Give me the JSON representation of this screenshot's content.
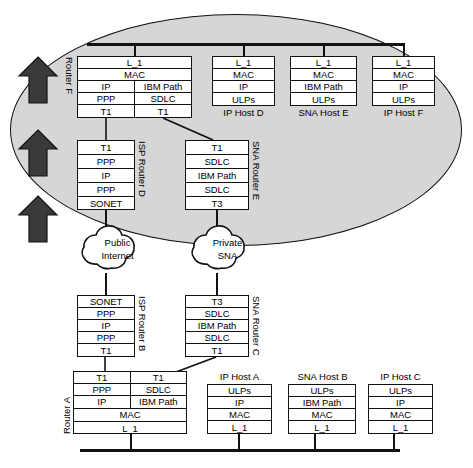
{
  "diagram": {
    "cloud_region_label": "",
    "colors": {
      "ellipse_fill": "#d6d6d6",
      "line": "#111111",
      "box_fill": "#ffffff"
    }
  },
  "arrows": {
    "name": "upward-flow-arrows",
    "count": 3,
    "direction": "up"
  },
  "top_bus": {
    "name": "upper-lan-segment"
  },
  "bottom_bus": {
    "name": "lower-lan-segment"
  },
  "clouds": [
    {
      "id": "public-internet",
      "line1": "Public",
      "line2": "Internet"
    },
    {
      "id": "private-sna",
      "line1": "Private",
      "line2": "SNA"
    }
  ],
  "stacks": [
    {
      "id": "router-f",
      "label": "Router F",
      "label_position": "left-vertical",
      "caption": "",
      "columns": 2,
      "rows": [
        {
          "cells": [
            "L_1"
          ],
          "span": true
        },
        {
          "cells": [
            "MAC"
          ],
          "span": true
        },
        {
          "cells": [
            "IP",
            "IBM Path"
          ],
          "span": false
        },
        {
          "cells": [
            "PPP",
            "SDLC"
          ],
          "span": false
        },
        {
          "cells": [
            "T1",
            "T1"
          ],
          "span": false
        }
      ]
    },
    {
      "id": "ip-host-d",
      "label": "",
      "caption": "IP Host D",
      "columns": 1,
      "rows": [
        {
          "cells": [
            "L_1"
          ],
          "span": true
        },
        {
          "cells": [
            "MAC"
          ],
          "span": true
        },
        {
          "cells": [
            "IP"
          ],
          "span": true
        },
        {
          "cells": [
            "ULPs"
          ],
          "span": true
        }
      ]
    },
    {
      "id": "sna-host-e",
      "label": "",
      "caption": "SNA Host E",
      "columns": 1,
      "rows": [
        {
          "cells": [
            "L_1"
          ],
          "span": true
        },
        {
          "cells": [
            "MAC"
          ],
          "span": true
        },
        {
          "cells": [
            "IBM Path"
          ],
          "span": true
        },
        {
          "cells": [
            "ULPs"
          ],
          "span": true
        }
      ]
    },
    {
      "id": "ip-host-f",
      "label": "",
      "caption": "IP Host F",
      "columns": 1,
      "rows": [
        {
          "cells": [
            "L_1"
          ],
          "span": true
        },
        {
          "cells": [
            "MAC"
          ],
          "span": true
        },
        {
          "cells": [
            "IP"
          ],
          "span": true
        },
        {
          "cells": [
            "ULPs"
          ],
          "span": true
        }
      ]
    },
    {
      "id": "isp-router-d",
      "label": "ISP Router D",
      "label_position": "right-vertical",
      "caption": "",
      "columns": 1,
      "rows": [
        {
          "cells": [
            "T1"
          ],
          "span": true
        },
        {
          "cells": [
            "PPP"
          ],
          "span": true
        },
        {
          "cells": [
            "IP"
          ],
          "span": true
        },
        {
          "cells": [
            "PPP"
          ],
          "span": true
        },
        {
          "cells": [
            "SONET"
          ],
          "span": true
        }
      ]
    },
    {
      "id": "sna-router-e",
      "label": "SNA Router E",
      "label_position": "right-vertical",
      "caption": "",
      "columns": 1,
      "rows": [
        {
          "cells": [
            "T1"
          ],
          "span": true
        },
        {
          "cells": [
            "SDLC"
          ],
          "span": true
        },
        {
          "cells": [
            "IBM  Path"
          ],
          "span": true
        },
        {
          "cells": [
            "SDLC"
          ],
          "span": true
        },
        {
          "cells": [
            "T3"
          ],
          "span": true
        }
      ]
    },
    {
      "id": "isp-router-b",
      "label": "ISP Router B",
      "label_position": "right-vertical",
      "caption": "",
      "columns": 1,
      "rows": [
        {
          "cells": [
            "SONET"
          ],
          "span": true
        },
        {
          "cells": [
            "PPP"
          ],
          "span": true
        },
        {
          "cells": [
            "IP"
          ],
          "span": true
        },
        {
          "cells": [
            "PPP"
          ],
          "span": true
        },
        {
          "cells": [
            "T1"
          ],
          "span": true
        }
      ]
    },
    {
      "id": "sna-router-c",
      "label": "SNA Router C",
      "label_position": "right-vertical",
      "caption": "",
      "columns": 1,
      "rows": [
        {
          "cells": [
            "T3"
          ],
          "span": true
        },
        {
          "cells": [
            "SDLC"
          ],
          "span": true
        },
        {
          "cells": [
            "IBM  Path"
          ],
          "span": true
        },
        {
          "cells": [
            "SDLC"
          ],
          "span": true
        },
        {
          "cells": [
            "T1"
          ],
          "span": true
        }
      ]
    },
    {
      "id": "router-a",
      "label": "Router A",
      "label_position": "left-vertical",
      "caption": "",
      "columns": 2,
      "rows": [
        {
          "cells": [
            "T1",
            "T1"
          ],
          "span": false
        },
        {
          "cells": [
            "PPP",
            "SDLC"
          ],
          "span": false
        },
        {
          "cells": [
            "IP",
            "IBM Path"
          ],
          "span": false
        },
        {
          "cells": [
            "MAC"
          ],
          "span": true
        },
        {
          "cells": [
            "L_1"
          ],
          "span": true
        }
      ]
    },
    {
      "id": "ip-host-a",
      "label": "",
      "caption": "IP Host A",
      "columns": 1,
      "rows": [
        {
          "cells": [
            "ULPs"
          ],
          "span": true
        },
        {
          "cells": [
            "IP"
          ],
          "span": true
        },
        {
          "cells": [
            "MAC"
          ],
          "span": true
        },
        {
          "cells": [
            "L_1"
          ],
          "span": true
        }
      ]
    },
    {
      "id": "sna-host-b",
      "label": "",
      "caption": "SNA Host B",
      "columns": 1,
      "rows": [
        {
          "cells": [
            "ULPs"
          ],
          "span": true
        },
        {
          "cells": [
            "IBM Path"
          ],
          "span": true
        },
        {
          "cells": [
            "MAC"
          ],
          "span": true
        },
        {
          "cells": [
            "L_1"
          ],
          "span": true
        }
      ]
    },
    {
      "id": "ip-host-c",
      "label": "",
      "caption": "IP Host C",
      "columns": 1,
      "rows": [
        {
          "cells": [
            "ULPs"
          ],
          "span": true
        },
        {
          "cells": [
            "IP"
          ],
          "span": true
        },
        {
          "cells": [
            "MAC"
          ],
          "span": true
        },
        {
          "cells": [
            "L_1"
          ],
          "span": true
        }
      ]
    }
  ]
}
